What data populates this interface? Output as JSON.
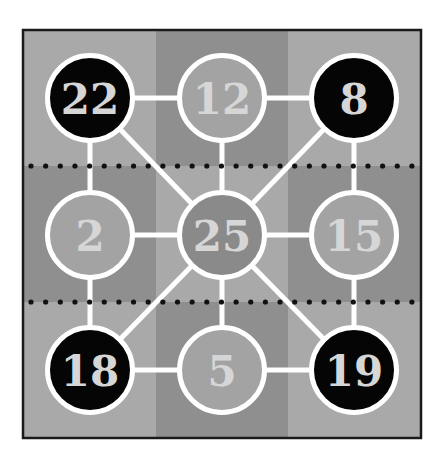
{
  "puzzle": {
    "board": {
      "x": 23,
      "y": 30,
      "width": 398,
      "height": 408,
      "border_color": "#1a1a1a",
      "light_bg": "#a9a9a9",
      "dark_bg": "#8f8f8f",
      "col_bounds": [
        23,
        156,
        288,
        421
      ],
      "row_bounds": [
        30,
        166,
        302,
        438
      ],
      "dotted_rows_y": [
        166,
        302
      ],
      "dot_color": "#111111"
    },
    "colors": {
      "edge": "#ffffff",
      "black_node_fill": "#050505",
      "gray_node_fill": "#a3a3a3",
      "center_node_fill": "#8a8a8a",
      "node_stroke": "#ffffff",
      "label": "#d6d6d6"
    },
    "nodes": [
      {
        "id": "n22",
        "label": "22",
        "x": 90,
        "y": 98,
        "type": "black"
      },
      {
        "id": "n12",
        "label": "12",
        "x": 222,
        "y": 98,
        "type": "gray"
      },
      {
        "id": "n8",
        "label": "8",
        "x": 354,
        "y": 98,
        "type": "black"
      },
      {
        "id": "n2",
        "label": "2",
        "x": 90,
        "y": 235,
        "type": "gray"
      },
      {
        "id": "n25",
        "label": "25",
        "x": 222,
        "y": 235,
        "type": "center"
      },
      {
        "id": "n15",
        "label": "15",
        "x": 354,
        "y": 235,
        "type": "gray"
      },
      {
        "id": "n18",
        "label": "18",
        "x": 90,
        "y": 370,
        "type": "black"
      },
      {
        "id": "n5",
        "label": "5",
        "x": 222,
        "y": 370,
        "type": "gray"
      },
      {
        "id": "n19",
        "label": "19",
        "x": 354,
        "y": 370,
        "type": "black"
      }
    ],
    "edges": [
      [
        "n22",
        "n12"
      ],
      [
        "n12",
        "n8"
      ],
      [
        "n2",
        "n25"
      ],
      [
        "n25",
        "n15"
      ],
      [
        "n18",
        "n5"
      ],
      [
        "n5",
        "n19"
      ],
      [
        "n22",
        "n2"
      ],
      [
        "n2",
        "n18"
      ],
      [
        "n8",
        "n15"
      ],
      [
        "n15",
        "n19"
      ],
      [
        "n12",
        "n25"
      ],
      [
        "n25",
        "n5"
      ],
      [
        "n22",
        "n25"
      ],
      [
        "n8",
        "n25"
      ],
      [
        "n18",
        "n25"
      ],
      [
        "n19",
        "n25"
      ]
    ],
    "node_radius": 45
  }
}
